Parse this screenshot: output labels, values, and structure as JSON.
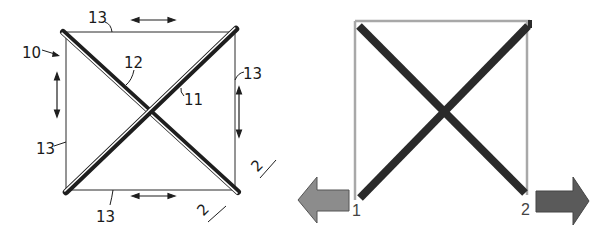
{
  "figures": {
    "left": {
      "title": "Patent drawing of cross-braced square frame",
      "labels": {
        "frame": "10",
        "rod_a": "11",
        "rod_b": "12",
        "side_top": "13",
        "side_right": "13",
        "side_left": "13",
        "side_bottom": "13",
        "section_right": "2",
        "section_bottom": "2"
      }
    },
    "right": {
      "title": "Schematic of cross-braced square with pulling arrows",
      "labels": {
        "node_left": "1",
        "node_right": "2"
      },
      "colors": {
        "frame": "#a8a8a8",
        "brace": "#2a2a2a",
        "arrow_left": "#8c8c8c",
        "arrow_right": "#5a5a5a"
      }
    }
  }
}
